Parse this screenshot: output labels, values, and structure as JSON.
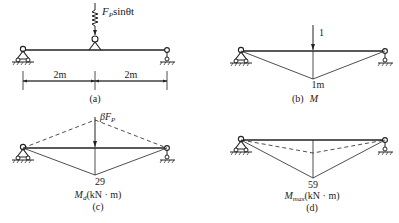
{
  "panels": {
    "a": {
      "caption": "(a)",
      "load_label_main": "F",
      "load_label_sub": "P",
      "load_label_rest": "sinθt",
      "spans": [
        {
          "label": "2m"
        },
        {
          "label": "2m"
        }
      ]
    },
    "b": {
      "caption": "(b)",
      "caption_symbol": "M",
      "unit_load_label": "1",
      "peak_value_label": "1m"
    },
    "c": {
      "caption": "(c)",
      "force_label_prefix": "βF",
      "force_label_sub": "P",
      "peak_value_label": "29",
      "diagram_label_main": "M",
      "diagram_label_sub": "d",
      "diagram_label_unit": "(kN · m)"
    },
    "d": {
      "caption": "(d)",
      "peak_value_label": "59",
      "diagram_label_main": "M",
      "diagram_label_sub": "max",
      "diagram_label_unit": "(kN · m)"
    }
  },
  "colors": {
    "ink": "#222222",
    "background": "#ffffff"
  }
}
